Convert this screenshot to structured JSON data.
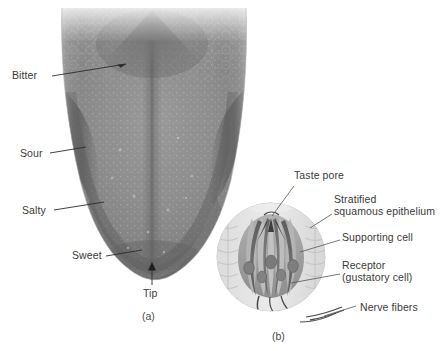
{
  "figure": {
    "panel_a": {
      "caption": "(a)",
      "subject": "tongue-dorsal-surface",
      "labels": [
        {
          "id": "bitter",
          "text": "Bitter",
          "x": 12,
          "y": 70
        },
        {
          "id": "sour",
          "text": "Sour",
          "x": 20,
          "y": 148
        },
        {
          "id": "salty",
          "text": "Salty",
          "x": 22,
          "y": 205
        },
        {
          "id": "sweet",
          "text": "Sweet",
          "x": 72,
          "y": 250
        },
        {
          "id": "tip",
          "text": "Tip",
          "x": 143,
          "y": 288
        }
      ]
    },
    "panel_b": {
      "caption": "(b)",
      "subject": "taste-bud-cross-section",
      "labels": [
        {
          "id": "taste-pore",
          "lines": [
            "Taste pore"
          ],
          "x": 294,
          "y": 170
        },
        {
          "id": "stratified-squamous-epithelium",
          "lines": [
            "Stratified",
            "squamous epithelium"
          ],
          "x": 334,
          "y": 194
        },
        {
          "id": "supporting-cell",
          "lines": [
            "Supporting cell"
          ],
          "x": 342,
          "y": 232
        },
        {
          "id": "receptor-gustatory-cell",
          "lines": [
            "Receptor",
            "(gustatory cell)"
          ],
          "x": 342,
          "y": 260
        },
        {
          "id": "nerve-fibers",
          "lines": [
            "Nerve fibers"
          ],
          "x": 360,
          "y": 302
        }
      ]
    }
  },
  "colors": {
    "background": "#ffffff",
    "label_text": "#3a3a3a",
    "leader_line": "#2b2b2b",
    "tongue_body": "#8d8d8d",
    "tongue_dark_band": "#5e5e5e",
    "tongue_mid_band": "#767676",
    "tongue_light_edge": "#c8c8c8",
    "tongue_back_dark": "#6a6a6a",
    "taste_bud_circle": "#e2e2e2",
    "taste_bud_cell": "#a3a3a3",
    "taste_bud_receptor": "#6f6f6f",
    "nucleus": "#7a7a7a"
  }
}
